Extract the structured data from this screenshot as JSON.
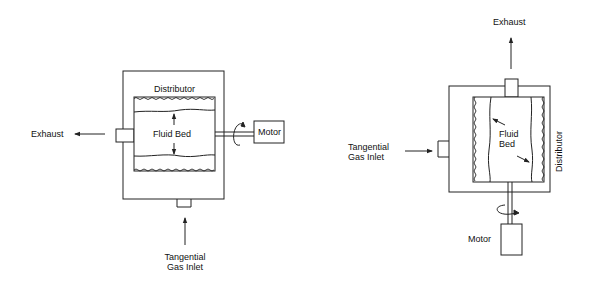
{
  "diagrams": [
    {
      "name": "horizontal-rotor-fluid-bed",
      "labels": {
        "distributor": "Distributor",
        "fluid_bed": "Fluid Bed",
        "exhaust": "Exhaust",
        "motor": "Motor",
        "gas_inlet_line1": "Tangential",
        "gas_inlet_line2": "Gas Inlet"
      }
    },
    {
      "name": "vertical-rotor-fluid-bed",
      "labels": {
        "exhaust": "Exhaust",
        "gas_inlet_line1": "Tangential",
        "gas_inlet_line2": "Gas Inlet",
        "fluid_bed_line1": "Fluid",
        "fluid_bed_line2": "Bed",
        "distributor": "Distributor",
        "motor": "Motor"
      }
    }
  ],
  "colors": {
    "line": "#222222",
    "background": "#ffffff"
  }
}
